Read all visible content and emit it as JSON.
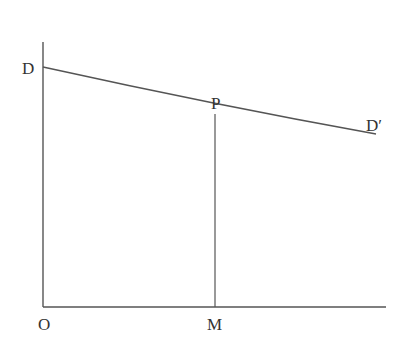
{
  "diagram": {
    "type": "demand-curve",
    "labels": {
      "d": "D",
      "d_prime": "D′",
      "p": "P",
      "o": "O",
      "m": "M"
    },
    "colors": {
      "line": "#555555",
      "text": "#333333",
      "background": "#ffffff"
    },
    "geometry": {
      "origin": [
        43,
        307
      ],
      "y_axis_top": [
        43,
        42
      ],
      "x_axis_end": [
        386,
        307
      ],
      "curve_start_D": [
        43,
        67
      ],
      "point_P": [
        215,
        114
      ],
      "curve_end_D_prime": [
        376,
        134
      ],
      "foot_M": [
        215,
        307
      ]
    }
  }
}
